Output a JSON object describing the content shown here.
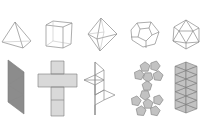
{
  "diagram": {
    "colors": {
      "background": "#ffffff",
      "edge": "#8a8a8a",
      "net_fill_dark": "#8c8c8c",
      "net_fill_light": "#d9d9d9",
      "net_fill_mid": "#c2c2c2"
    },
    "solids": [
      {
        "name": "tetrahedron",
        "faces": 4,
        "face_shape": "triangle"
      },
      {
        "name": "cube",
        "faces": 6,
        "face_shape": "square"
      },
      {
        "name": "octahedron",
        "faces": 8,
        "face_shape": "triangle"
      },
      {
        "name": "dodecahedron",
        "faces": 12,
        "face_shape": "pentagon"
      },
      {
        "name": "icosahedron",
        "faces": 20,
        "face_shape": "triangle"
      }
    ]
  }
}
